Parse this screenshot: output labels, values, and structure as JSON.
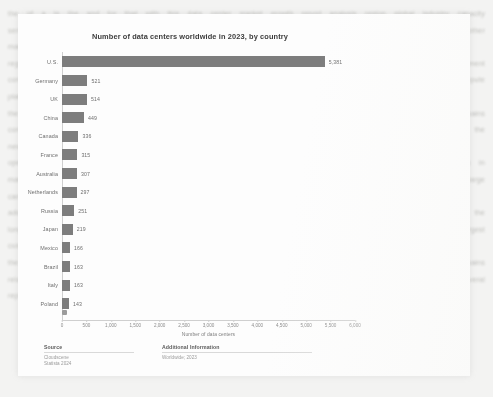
{
  "background": {
    "document_text": "the  of  a  in  the  and  for  that  with  this  data  center  market  growth  report  analysis  region  global  industry  capacity  server  facility  provider  network  service  power  cloud  which  their  from  have  more  been  such  also  only  these  other  many  over  than  some  time  into  year  most  both  when  each  well\nregional  expansion  infrastructure  deployment  colocation  hyperscale  operators  demand  energy  efficiency  investment  construction  availability  connectivity  enterprise  workload  environment  resilience  redundancy  latency  storage  compute  platform  migration  strategy\nthe  number  of  facilities  continues  to  increase  across  every  major  market  while  the  largest  share  remains  concentrated  in  a  small  group  of  countries  that  host  the  bulk  of  the  global  footprint  and  drive  most  of  the  new  capacity  additions  each  year\noperators  report  that  rising  power  costs  and  limited  grid  availability  are  the  primary  constraints  on  new  builds  in  mature  metropolitan  areas  while  secondary  markets  offer  cheaper  land  and  faster  permitting  timelines  for  large  campus  projects\nadditional  considerations  include  water  usage  cooling  technology  selection  renewable  sourcing  agreements  and  the  long  term  supply  of  specialised  equipment  needed  to  fit  out  halls  at  the  scale  required  by  the  largest  customers  in  the  sector\nthe  following  chart  summarises  the  distribution  by  country  and  shows  how  dominant  a  single  market  remains  relative  to  all  others  in  the  ranking  even  as  growth  rates  elsewhere  have  accelerated  over  the  past  several  reporting  periods"
  },
  "chart_card": {
    "title": "Number of data centers worldwide in 2023, by country"
  },
  "chart_data": {
    "type": "bar",
    "orientation": "horizontal",
    "title": "Number of data centers worldwide in 2023, by country",
    "xlabel": "Number of data centers",
    "ylabel": "",
    "xlim": [
      0,
      6000
    ],
    "grid": false,
    "legend": null,
    "categories": [
      "U.S.",
      "Germany",
      "UK",
      "China",
      "Canada",
      "France",
      "Australia",
      "Netherlands",
      "Russia",
      "Japan",
      "Mexico",
      "Brazil",
      "Italy",
      "Poland"
    ],
    "values": [
      5381,
      521,
      514,
      449,
      336,
      315,
      307,
      297,
      251,
      219,
      166,
      163,
      163,
      143
    ],
    "value_labels": [
      "5,381",
      "521",
      "514",
      "449",
      "336",
      "315",
      "307",
      "297",
      "251",
      "219",
      "166",
      "163",
      "163",
      "143"
    ],
    "xticks": [
      0,
      500,
      1000,
      1500,
      2000,
      2500,
      3000,
      3500,
      4000,
      4500,
      5000,
      5500,
      6000
    ],
    "xtick_labels": [
      "0",
      "500",
      "1,000",
      "1,500",
      "2,000",
      "2,500",
      "3,000",
      "3,500",
      "4,000",
      "4,500",
      "5,000",
      "5,500",
      "6,000"
    ],
    "bar_color": "#7d7d7d"
  },
  "footer": {
    "source": {
      "heading": "Source",
      "lines": [
        "Cloudscene",
        "Statista 2024"
      ]
    },
    "additional": {
      "heading": "Additional Information",
      "lines": [
        "Worldwide; 2023"
      ]
    }
  }
}
